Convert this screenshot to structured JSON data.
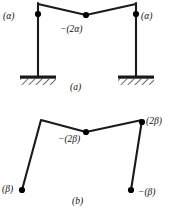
{
  "figure": {
    "colors": {
      "ink": "#111111",
      "background": "#ffffff",
      "member": "#1a1a1a",
      "node": "#000000",
      "hatch": "#222222"
    },
    "panels": [
      {
        "id": "a",
        "caption": "(a)",
        "labels": {
          "left_node": "(α)",
          "right_node": "(α)",
          "center_node": "−(2α)"
        },
        "supports": "fixed-hatched-base",
        "nodes": [
          {
            "name": "left-joint",
            "x": 38,
            "y": 14,
            "label": "(α)"
          },
          {
            "name": "center-joint",
            "x": 86,
            "y": 15,
            "label": "−(2α)"
          },
          {
            "name": "right-joint",
            "x": 136,
            "y": 14,
            "label": "(α)"
          }
        ],
        "members": [
          {
            "name": "left-column",
            "from": [
              38,
              13
            ],
            "to": [
              38,
              78
            ]
          },
          {
            "name": "right-column",
            "from": [
              136,
              13
            ],
            "to": [
              136,
              78
            ]
          },
          {
            "name": "left-beam-segment",
            "from": [
              38,
              4
            ],
            "to": [
              86,
              15
            ]
          },
          {
            "name": "right-beam-segment",
            "from": [
              86,
              15
            ],
            "to": [
              136,
              4
            ]
          },
          {
            "name": "left-beam-stub",
            "from": [
              38,
              4
            ],
            "to": [
              38,
              14
            ]
          },
          {
            "name": "right-beam-stub",
            "from": [
              136,
              4
            ],
            "to": [
              136,
              14
            ]
          }
        ],
        "bases": [
          {
            "name": "left-base",
            "x1": 20,
            "x2": 56,
            "y": 78
          },
          {
            "name": "right-base",
            "x1": 118,
            "x2": 154,
            "y": 78
          }
        ]
      },
      {
        "id": "b",
        "caption": "(b)",
        "labels": {
          "left_node": "(β)",
          "right_node": "−(β)",
          "upper_right_node": "(2β)",
          "center_node": "−(2β)"
        },
        "supports": "free-pinned-ends",
        "nodes": [
          {
            "name": "lower-left-node",
            "x": 22,
            "y": 190,
            "label": "(β)"
          },
          {
            "name": "center-joint",
            "x": 86,
            "y": 132,
            "label": "−(2β)"
          },
          {
            "name": "upper-right-joint",
            "x": 142,
            "y": 122,
            "label": "(2β)"
          },
          {
            "name": "lower-right-node",
            "x": 131,
            "y": 190,
            "label": "−(β)"
          }
        ],
        "members": [
          {
            "name": "left-leg",
            "from": [
              22,
              190
            ],
            "to": [
              41,
              120
            ]
          },
          {
            "name": "left-beam-segment",
            "from": [
              41,
              120
            ],
            "to": [
              86,
              132
            ]
          },
          {
            "name": "right-beam-segment",
            "from": [
              86,
              132
            ],
            "to": [
              142,
              120
            ]
          },
          {
            "name": "right-leg",
            "from": [
              142,
              122
            ],
            "to": [
              131,
              190
            ]
          }
        ]
      }
    ]
  }
}
